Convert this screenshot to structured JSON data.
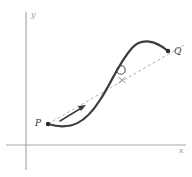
{
  "figure": {
    "background_color": "#ffffff"
  },
  "axes": {
    "x_label": "x",
    "y_label": "y",
    "axis_color": "#a8a8a8",
    "origin": {
      "x": 26,
      "y": 145
    },
    "x_axis": {
      "x1": 6,
      "y1": 145,
      "x2": 186,
      "y2": 145
    },
    "y_axis": {
      "x1": 26,
      "y1": 12,
      "x2": 26,
      "y2": 170
    }
  },
  "curve": {
    "name": "function-curve",
    "color": "#3c3c3c",
    "stroke_width": 2.2,
    "path": "M 48,124 C 72,131 86,122 100,100 C 112,82 118,64 132,48 C 142,37 156,41 168,51"
  },
  "secant": {
    "name": "secant-line",
    "color": "#b0b0b0",
    "stroke_width": 1,
    "dash": "3,2.5",
    "x1": 48,
    "y1": 124,
    "x2": 186,
    "y2": 44
  },
  "arrow": {
    "name": "direction-arrow",
    "color": "#3c3c3c",
    "x1": 60,
    "y1": 121,
    "x2": 85,
    "y2": 106
  },
  "points": [
    {
      "name": "point-p",
      "label": "P",
      "x": 48,
      "y": 124,
      "label_x": 36,
      "label_y": 126,
      "color": "#2a2a2a",
      "radius": 2.2
    },
    {
      "name": "point-q",
      "label": "Q",
      "x": 168,
      "y": 51,
      "label_x": 174,
      "label_y": 53,
      "color": "#2a2a2a",
      "radius": 2.2
    }
  ],
  "marker": {
    "name": "open-circle-marker",
    "x": 121,
    "y": 70,
    "radius": 4.2,
    "color": "#4a4a4a",
    "cross_x": 122,
    "cross_y": 80,
    "cross_size": 3.5
  }
}
